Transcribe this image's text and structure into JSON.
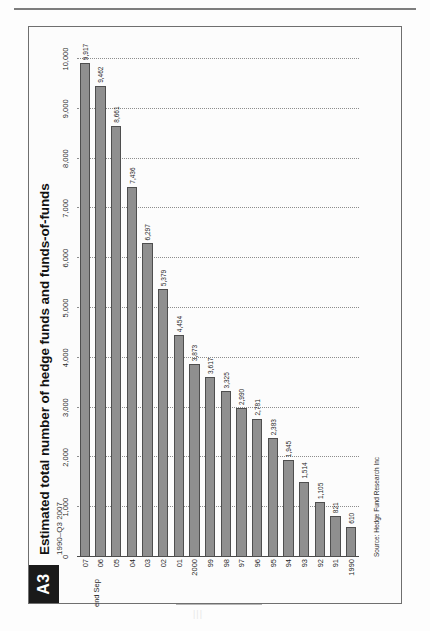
{
  "figure": {
    "badge": "A3",
    "title": "Estimated total number of hedge funds and funds-of-funds",
    "subtitle": "1990–Q3 2007",
    "source": "Source: Hedge Fund Research Inc",
    "last_category_note": "end Sep",
    "bar_color": "#8f8f8f",
    "bar_border_color": "#4e4e4e",
    "badge_bg": "#1a1a1a",
    "grid": "dotted-vertical"
  },
  "chart_data": {
    "type": "bar",
    "orientation": "horizontal",
    "title": "Estimated total number of hedge funds and funds-of-funds",
    "subtitle": "1990–Q3 2007",
    "xlabel": "",
    "ylabel": "",
    "xlim": [
      0,
      10000
    ],
    "ticks": [
      "0",
      "1,000",
      "2,000",
      "3,000",
      "4,000",
      "5,000",
      "6,000",
      "7,000",
      "8,000",
      "9,000",
      "10,000"
    ],
    "tick_values": [
      0,
      1000,
      2000,
      3000,
      4000,
      5000,
      6000,
      7000,
      8000,
      9000,
      10000
    ],
    "grid": true,
    "legend": false,
    "categories": [
      "1990",
      "91",
      "92",
      "93",
      "94",
      "95",
      "96",
      "97",
      "98",
      "99",
      "2000",
      "01",
      "02",
      "03",
      "04",
      "05",
      "06",
      "07"
    ],
    "values": [
      610,
      821,
      1105,
      1514,
      1945,
      2383,
      2781,
      2990,
      3325,
      3617,
      3873,
      4454,
      5379,
      6297,
      7436,
      8661,
      9462,
      9917
    ],
    "value_labels": [
      "610",
      "821",
      "1,105",
      "1,514",
      "1,945",
      "2,383",
      "2,781",
      "2,990",
      "3,325",
      "3,617",
      "3,873",
      "4,454",
      "5,379",
      "6,297",
      "7,436",
      "8,661",
      "9,462",
      "9,917"
    ],
    "annotations": [
      "end Sep"
    ],
    "source": "Source: Hedge Fund Research Inc"
  },
  "page": {
    "bottom_mark": "|||"
  }
}
